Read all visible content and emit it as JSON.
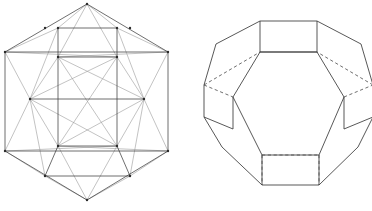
{
  "plate": {
    "background_color": "#ffffff",
    "line_color": "#3a3a3a",
    "faint_line_color": "#8f8f8f",
    "vertex_color": "#2b2b2b",
    "figure_count": 2
  },
  "figures": [
    {
      "id": "left-figure",
      "name": "hexagonal-projection-wireframe",
      "description": "Hexagonal outline wireframe projection of a semiregular polyhedron viewed along a three-fold axis, all edges drawn including those behind the solid, producing interlocking triangles and squares",
      "outline_shape": "hexagon",
      "line_style": "solid",
      "hidden_edges_shown": true,
      "vertex_dots": true
    },
    {
      "id": "right-figure",
      "name": "truncated-solid-perspective",
      "description": "Octagon-outlined solid built from square faces around a large central hexagonal face, with hidden rear edges drawn dashed",
      "outline_shape": "octagon",
      "line_style": "solid-with-dashed-hidden-edges",
      "hidden_edges_shown": true,
      "vertex_dots": false
    }
  ],
  "chart_data": {
    "type": "line",
    "title": "",
    "xlabel": "",
    "ylabel": "",
    "grid": false,
    "legend": "none",
    "xlim": [
      0,
      372
    ],
    "ylim": [
      0,
      211
    ],
    "left_figure": {
      "vertices": {
        "top_apex": [
          87,
          4
        ],
        "upper_left": [
          45,
          28
        ],
        "upper_right": [
          130,
          28
        ],
        "left_top": [
          5,
          52
        ],
        "right_top": [
          168,
          52
        ],
        "sq_tl": [
          58,
          28
        ],
        "sq_tr": [
          117,
          28
        ],
        "hub_left": [
          30,
          99
        ],
        "hub_right": [
          144,
          99
        ],
        "inner_tl": [
          58,
          57
        ],
        "inner_tr": [
          117,
          57
        ],
        "inner_bl": [
          58,
          146
        ],
        "inner_br": [
          117,
          146
        ],
        "left_bottom": [
          5,
          151
        ],
        "right_bottom": [
          168,
          151
        ],
        "lower_left": [
          45,
          176
        ],
        "lower_right": [
          130,
          176
        ],
        "bottom_apex": [
          87,
          200
        ]
      },
      "edges_outline": [
        [
          "top_apex",
          "left_top"
        ],
        [
          "top_apex",
          "right_top"
        ],
        [
          "left_top",
          "left_bottom"
        ],
        [
          "right_top",
          "right_bottom"
        ],
        [
          "left_bottom",
          "bottom_apex"
        ],
        [
          "right_bottom",
          "bottom_apex"
        ]
      ],
      "edges_inner": [
        [
          "inner_tl",
          "inner_tr"
        ],
        [
          "inner_tr",
          "inner_br"
        ],
        [
          "inner_br",
          "inner_bl"
        ],
        [
          "inner_bl",
          "inner_tl"
        ],
        [
          "sq_tl",
          "sq_tr"
        ],
        [
          "sq_tl",
          "inner_tl"
        ],
        [
          "sq_tr",
          "inner_tr"
        ],
        [
          "lower_left",
          "lower_right"
        ],
        [
          "lower_left",
          "inner_bl"
        ],
        [
          "lower_right",
          "inner_br"
        ],
        [
          "left_top",
          "right_top"
        ],
        [
          "left_bottom",
          "right_bottom"
        ],
        [
          "hub_left",
          "hub_right"
        ]
      ],
      "edges_diagonal": [
        [
          "top_apex",
          "inner_tl"
        ],
        [
          "top_apex",
          "inner_tr"
        ],
        [
          "bottom_apex",
          "inner_bl"
        ],
        [
          "bottom_apex",
          "inner_br"
        ],
        [
          "left_top",
          "hub_left"
        ],
        [
          "left_bottom",
          "hub_left"
        ],
        [
          "right_top",
          "hub_right"
        ],
        [
          "right_bottom",
          "hub_right"
        ],
        [
          "hub_left",
          "inner_tl"
        ],
        [
          "hub_left",
          "inner_bl"
        ],
        [
          "hub_right",
          "inner_tr"
        ],
        [
          "hub_right",
          "inner_br"
        ],
        [
          "left_top",
          "inner_tr"
        ],
        [
          "right_top",
          "inner_tl"
        ],
        [
          "left_bottom",
          "inner_br"
        ],
        [
          "right_bottom",
          "inner_bl"
        ],
        [
          "inner_tl",
          "inner_br"
        ],
        [
          "inner_tr",
          "inner_bl"
        ],
        [
          "hub_left",
          "inner_tr"
        ],
        [
          "hub_left",
          "inner_br"
        ],
        [
          "hub_right",
          "inner_tl"
        ],
        [
          "hub_right",
          "inner_bl"
        ],
        [
          "sq_tl",
          "hub_left"
        ],
        [
          "sq_tr",
          "hub_right"
        ],
        [
          "lower_left",
          "hub_left"
        ],
        [
          "lower_right",
          "hub_right"
        ],
        [
          "top_apex",
          "sq_tl"
        ],
        [
          "top_apex",
          "sq_tr"
        ],
        [
          "bottom_apex",
          "lower_left"
        ],
        [
          "bottom_apex",
          "lower_right"
        ],
        [
          "left_top",
          "sq_tl"
        ],
        [
          "right_top",
          "sq_tr"
        ],
        [
          "left_bottom",
          "lower_left"
        ],
        [
          "right_bottom",
          "lower_right"
        ]
      ]
    },
    "right_figure": {
      "vertices": {
        "t_sq_tl": [
          74,
          21
        ],
        "t_sq_tr": [
          131,
          21
        ],
        "t_sq_bl": [
          74,
          52
        ],
        "t_sq_br": [
          131,
          52
        ],
        "ul_out_t": [
          30,
          44
        ],
        "ul_out_b": [
          18,
          85
        ],
        "ur_out_t": [
          175,
          44
        ],
        "ur_out_b": [
          187,
          85
        ],
        "l_sq_tl": [
          18,
          85
        ],
        "l_sq_tr": [
          47,
          97
        ],
        "l_sq_bl": [
          18,
          117
        ],
        "l_sq_br": [
          47,
          129
        ],
        "r_sq_tl": [
          158,
          97
        ],
        "r_sq_tr": [
          187,
          85
        ],
        "r_sq_bl": [
          158,
          129
        ],
        "r_sq_br": [
          187,
          117
        ],
        "b_sq_tl": [
          76,
          155
        ],
        "b_sq_tr": [
          133,
          155
        ],
        "b_sq_bl": [
          76,
          185
        ],
        "b_sq_br": [
          133,
          185
        ],
        "ll_out": [
          36,
          147
        ],
        "lr_out": [
          172,
          147
        ],
        "hex_t_l": [
          74,
          52
        ],
        "hex_t_r": [
          131,
          52
        ],
        "hex_r": [
          158,
          97
        ],
        "hex_br": [
          133,
          155
        ],
        "hex_bl": [
          76,
          155
        ],
        "hex_l": [
          47,
          97
        ]
      },
      "edges_solid": [
        [
          "t_sq_tl",
          "t_sq_tr"
        ],
        [
          "t_sq_tl",
          "t_sq_bl"
        ],
        [
          "t_sq_tr",
          "t_sq_br"
        ],
        [
          "t_sq_bl",
          "t_sq_br"
        ],
        [
          "t_sq_tl",
          "ul_out_t"
        ],
        [
          "t_sq_tr",
          "ur_out_t"
        ],
        [
          "ul_out_t",
          "ul_out_b"
        ],
        [
          "ur_out_t",
          "ur_out_b"
        ],
        [
          "l_sq_tl",
          "l_sq_bl"
        ],
        [
          "l_sq_tr",
          "l_sq_br"
        ],
        [
          "l_sq_bl",
          "l_sq_br"
        ],
        [
          "r_sq_tr",
          "r_sq_br"
        ],
        [
          "r_sq_tl",
          "r_sq_bl"
        ],
        [
          "r_sq_bl",
          "r_sq_br"
        ],
        [
          "l_sq_bl",
          "ll_out"
        ],
        [
          "r_sq_br",
          "lr_out"
        ],
        [
          "ll_out",
          "b_sq_bl"
        ],
        [
          "lr_out",
          "b_sq_br"
        ],
        [
          "b_sq_bl",
          "b_sq_br"
        ],
        [
          "b_sq_tl",
          "b_sq_bl"
        ],
        [
          "b_sq_tr",
          "b_sq_br"
        ],
        [
          "hex_t_l",
          "hex_t_r"
        ],
        [
          "hex_t_r",
          "hex_r"
        ],
        [
          "hex_r",
          "hex_br"
        ],
        [
          "hex_br",
          "hex_bl"
        ],
        [
          "hex_bl",
          "hex_l"
        ],
        [
          "hex_l",
          "hex_t_l"
        ],
        [
          "l_sq_tr",
          "hex_l"
        ],
        [
          "r_sq_tl",
          "hex_r"
        ],
        [
          "b_sq_tl",
          "hex_bl"
        ],
        [
          "b_sq_tr",
          "hex_br"
        ]
      ],
      "edges_dashed": [
        [
          "ul_out_b",
          "hex_t_l"
        ],
        [
          "ur_out_b",
          "hex_t_r"
        ],
        [
          "l_sq_tl",
          "l_sq_tr"
        ],
        [
          "r_sq_tl",
          "r_sq_tr"
        ],
        [
          "b_sq_tl",
          "b_sq_bl"
        ],
        [
          "b_sq_tr",
          "b_sq_br"
        ],
        [
          "b_sq_tl",
          "b_sq_tr"
        ]
      ]
    }
  }
}
